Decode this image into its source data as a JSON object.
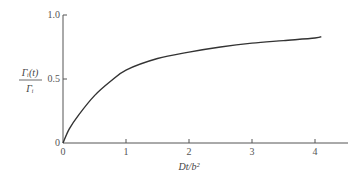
{
  "chart_data": {
    "type": "line",
    "title": "",
    "xlabel": "Dt/b²",
    "ylabel_numerator": "Γᵢ(t)",
    "ylabel_denominator": "Γᵢ",
    "ylabel": "Γᵢ(t)/Γᵢ",
    "xlim": [
      0,
      4.5
    ],
    "ylim": [
      0,
      1.0
    ],
    "x_ticks": [
      "0",
      "1",
      "2",
      "3",
      "4"
    ],
    "y_ticks": [
      "0",
      "0.5",
      "1.0"
    ],
    "grid": false,
    "legend": null,
    "series": [
      {
        "name": "Γᵢ(t)/Γᵢ",
        "x": [
          0,
          0.1,
          0.25,
          0.5,
          0.75,
          1.0,
          1.5,
          2.0,
          2.5,
          3.0,
          3.5,
          4.0,
          4.1
        ],
        "y": [
          0,
          0.11,
          0.22,
          0.37,
          0.48,
          0.57,
          0.66,
          0.71,
          0.75,
          0.78,
          0.8,
          0.82,
          0.83
        ]
      }
    ]
  }
}
